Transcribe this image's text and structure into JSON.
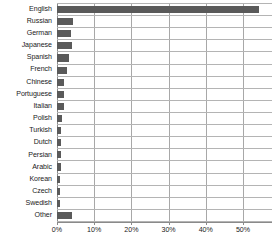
{
  "chart_data": {
    "type": "bar",
    "orientation": "horizontal",
    "title": "",
    "subtitle": "",
    "xlabel": "",
    "ylabel": "",
    "xlim": [
      0,
      57.8
    ],
    "grid": true,
    "legend": null,
    "bar_color": "#5a5a5a",
    "grid_color": "#b4b4b4",
    "axis_color": "#8a8a8a",
    "xtick_labels": [
      "0%",
      "10%",
      "20%",
      "30%",
      "40%",
      "50%"
    ],
    "xtick_values": [
      0,
      10,
      20,
      30,
      40,
      50
    ],
    "categories": [
      "English",
      "Russian",
      "German",
      "Japanese",
      "Spanish",
      "French",
      "Chinese",
      "Portuguese",
      "Italian",
      "Polish",
      "Turkish",
      "Dutch",
      "Persian",
      "Arabic",
      "Korean",
      "Czech",
      "Swedish",
      "Other"
    ],
    "values": [
      54.3,
      4.3,
      3.8,
      4.0,
      3.1,
      2.6,
      2.0,
      1.9,
      1.8,
      1.3,
      1.2,
      1.1,
      1.1,
      1.0,
      0.9,
      0.8,
      0.8,
      4.1
    ]
  }
}
